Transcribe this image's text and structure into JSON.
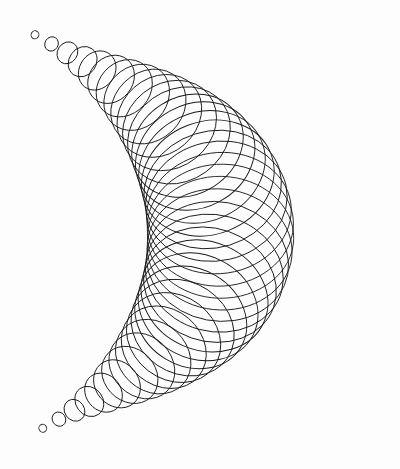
{
  "artwork": {
    "title": "Plotter drawing: crescent of overlapping ellipses",
    "background": "#fdfdfd",
    "stroke_color": "#1a1a1a",
    "stroke_width": 0.9,
    "ellipse_count": 40,
    "tip_top": [
      26,
      31
    ],
    "tip_bottom": [
      34,
      432
    ],
    "center_control": [
      360,
      232
    ],
    "max_major_radius": 78,
    "max_minor_radius": 58,
    "min_radius": 3
  }
}
